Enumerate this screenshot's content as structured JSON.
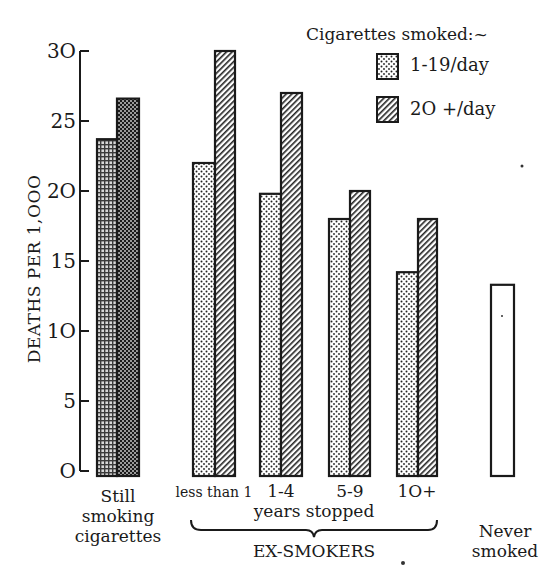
{
  "chart_data": {
    "type": "bar",
    "title": "",
    "xlabel": "",
    "ylabel": "DEATHS PER 1,000",
    "ylim": [
      0,
      30
    ],
    "yticks": [
      0,
      5,
      10,
      15,
      20,
      25,
      30
    ],
    "ytick_labels": [
      "O",
      "5",
      "1O",
      "15",
      "2O",
      "25",
      "3O"
    ],
    "grid": false,
    "legend_position": "top-right",
    "legend_title": "Cigarettes smoked:~",
    "categories": [
      "Still smoking cigarettes",
      "less than 1",
      "1-4",
      "5-9",
      "10+",
      "Never smoked"
    ],
    "series": [
      {
        "name": "1-19/day",
        "pattern": "dotted",
        "values": [
          23.7,
          22,
          19.8,
          18,
          14.2,
          null
        ]
      },
      {
        "name": "20+/day",
        "pattern": "diagonal-hatch",
        "values": [
          26.6,
          30,
          27,
          20,
          18,
          null
        ]
      },
      {
        "name": "Never smoked",
        "pattern": "blank",
        "values": [
          null,
          null,
          null,
          null,
          null,
          13.3
        ]
      }
    ],
    "group_annotation": {
      "label": "EX-SMOKERS",
      "sublabel": "years stopped",
      "spans": [
        "less than 1",
        "1-4",
        "5-9",
        "10+"
      ]
    }
  },
  "labels": {
    "ylabel": "DEATHS PER 1,OOO",
    "legend_title": "Cigarettes smoked:~",
    "legend_1": "1-19/day",
    "legend_2": "2O +/day",
    "cat_still": [
      "Still",
      "smoking",
      "cigarettes"
    ],
    "cat_lt1": "less than 1",
    "cat_1_4": "1-4",
    "cat_5_9": "5-9",
    "cat_10": "1O+",
    "years_stopped": "years stopped",
    "ex_smokers": "EX-SMOKERS",
    "cat_never": [
      "Never",
      "smoked"
    ]
  },
  "colors": {
    "ink": "#1a1a1a",
    "paper": "#ffffff"
  }
}
